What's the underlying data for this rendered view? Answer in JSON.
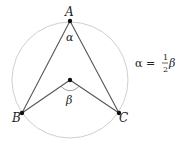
{
  "diagram": {
    "circle": {
      "cx": 70,
      "cy": 80,
      "r": 58,
      "color": "#cccccc"
    },
    "points": [
      {
        "name": "A",
        "x": 70,
        "y": 21
      },
      {
        "name": "B",
        "x": 22,
        "y": 113
      },
      {
        "name": "C",
        "x": 119,
        "y": 113
      },
      {
        "name": "O",
        "x": 70,
        "y": 80
      }
    ],
    "labels": {
      "A": "A",
      "B": "B",
      "C": "C",
      "alpha": "α",
      "beta": "β"
    },
    "equation": {
      "lhs": "α =",
      "frac_num": "1",
      "frac_den": "2",
      "rhs": "β"
    },
    "line_color": "#555555"
  }
}
